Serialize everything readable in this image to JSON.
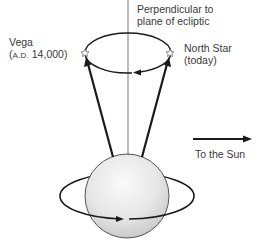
{
  "labels": {
    "perpendicular_line1": "Perpendicular to",
    "perpendicular_line2": "plane of ecliptic",
    "vega_name": "Vega",
    "vega_era_prefix": "A.D.",
    "vega_era_year": "14,000",
    "vega_open_paren": "(",
    "vega_close_paren": ")",
    "north_star_name": "North Star",
    "north_star_era": "(today)",
    "sun_direction": "To the Sun"
  },
  "icons": {
    "vega_marker": "star-outline-icon",
    "north_star_marker": "star-outline-icon",
    "sun_arrow": "arrow-right-icon"
  },
  "colors": {
    "line": "#1a1a1a",
    "axis_thin": "#555555",
    "sphere_light": "#f4f4f4",
    "sphere_dark": "#c8c8c8",
    "text": "#3a3a3a"
  }
}
